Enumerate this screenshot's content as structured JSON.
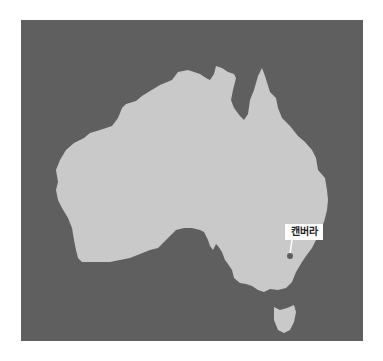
{
  "map": {
    "region": "Australia",
    "colors": {
      "sea": "#5f5f5f",
      "land": "#c9c9c9",
      "marker": "#5f5f5f",
      "label_bg": "#ffffff",
      "page_bg": "#ffffff"
    },
    "markers": [
      {
        "name": "캔버라",
        "label": "캔버라",
        "x": 290,
        "y": 256
      }
    ]
  }
}
